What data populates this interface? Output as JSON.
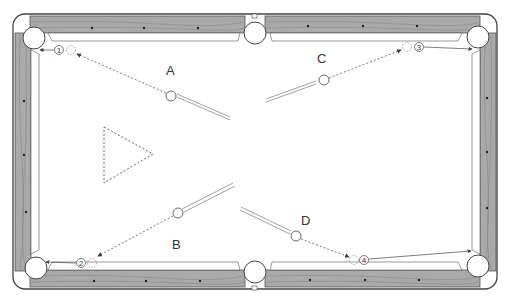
{
  "diagram": {
    "type": "pool-table-shot-diagram",
    "colors": {
      "rail_wood": "#a9a9a9",
      "rail_outline": "#444444",
      "felt": "#ffffff",
      "line": "#555555",
      "diamond": "#222222"
    },
    "shots": [
      {
        "label": "A",
        "target_number": "1",
        "pocket": "top-left"
      },
      {
        "label": "B",
        "target_number": "2",
        "pocket": "bottom-left"
      },
      {
        "label": "C",
        "target_number": "3",
        "pocket": "top-right"
      },
      {
        "label": "D",
        "target_number": "4",
        "pocket": "bottom-right"
      }
    ],
    "rack": {
      "shape": "triangle",
      "style": "dashed"
    }
  }
}
